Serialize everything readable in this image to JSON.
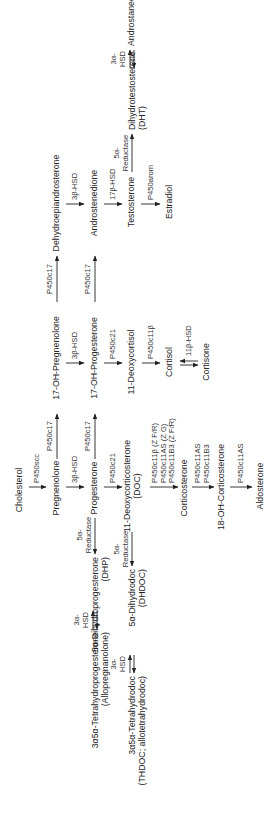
{
  "diagram": {
    "orientation": "rotated-90-ccw",
    "compounds": {
      "cholesterol": "Cholesterol",
      "pregnenolone": "Pregnenolone",
      "oh17_pregnenolone": "17-OH-Pregnenolone",
      "dhea": "Dehydroepiandrosterone",
      "progesterone": "Progesterone",
      "oh17_progesterone": "17-OH-Progesterone",
      "androstenedione": "Androstenedione",
      "doc_line1": "11-Deoxycorticosterone",
      "doc_line2": "(DOC)",
      "deoxycortisol": "11-Deoxycortisol",
      "testosterone": "Testosterone",
      "corticosterone": "Corticosterone",
      "cortisol": "Cortisol",
      "estradiol": "Estradiol",
      "oh18_corticosterone": "18-OH-Corticosterone",
      "cortisone": "Cortisone",
      "aldosterone": "Aldosterone",
      "dht_line1": "Dihydrotestosterone",
      "dht_line2": "(DHT)",
      "androstanediol": "Androstanediol",
      "dhp_line1": "5α-Dihydroprogesterone",
      "dhp_line2": "(DHP)",
      "dhdoc_line1": "5α-Dihydrodoc",
      "dhdoc_line2": "(DHDOC)",
      "allopregnanolone_line1": "3α5α-Tetrahydroprogesterone",
      "allopregnanolone_line2": "(Allopregnanolone)",
      "thdoc_line1": "3α5α-Tetrahydrodoc",
      "thdoc_line2": "(THDOC; allotetrahydrodoc)"
    },
    "enzymes": {
      "p450scc": "P450scc",
      "p450c17_a": "P450c17",
      "p450c17_b": "P450c17",
      "p450c17_c": "P450c17",
      "p450c17_d": "P450c17",
      "hsd3b_a": "3β-HSD",
      "hsd3b_b": "3β-HSD",
      "hsd3b_c": "3β-HSD",
      "p450c21_a": "P450c21",
      "p450c21_b": "P450c21",
      "hsd17b": "17β-HSD",
      "p450c11_line1": "P450c11β (Z F/R)",
      "p450c11_line2": "P450c11AS (Z G)",
      "p450c11_line3": "P450c11B3 (Z F/R)",
      "p450c11b": "P450c11β",
      "p450arom": "P450arom",
      "p450c11as_a_line1": "P450c11AS",
      "p450c11as_a_line2": "P450c11B3",
      "p450c11as_b": "P450c11AS",
      "hsd11b": "11β-HSD",
      "red5a_top_line1": "5α-",
      "red5a_top_line2": "Reductase",
      "red5a_a_line1": "5α-",
      "red5a_a_line2": "Reductase",
      "red5a_b_line1": "5α-",
      "red5a_b_line2": "Reductase",
      "hsd3a_top_line1": "3α-",
      "hsd3a_top_line2": "HSD",
      "hsd3a_a_line1": "3α-",
      "hsd3a_a_line2": "HSD",
      "hsd3a_b_line1": "3α-",
      "hsd3a_b_line2": "HSD"
    }
  }
}
